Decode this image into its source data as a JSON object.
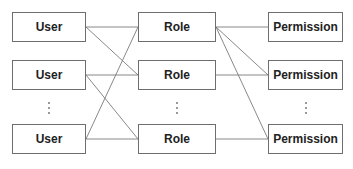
{
  "diagram": {
    "columns": [
      {
        "name": "users",
        "label": "User",
        "x": 12,
        "width": 74,
        "nodes": [
          {
            "id": "u1",
            "label": "User",
            "y": 12
          },
          {
            "id": "u2",
            "label": "User",
            "y": 60
          },
          {
            "id": "u3",
            "label": "User",
            "y": 124
          }
        ]
      },
      {
        "name": "roles",
        "label": "Role",
        "x": 138,
        "width": 78,
        "nodes": [
          {
            "id": "r1",
            "label": "Role",
            "y": 12
          },
          {
            "id": "r2",
            "label": "Role",
            "y": 60
          },
          {
            "id": "r3",
            "label": "Role",
            "y": 124
          }
        ]
      },
      {
        "name": "permissions",
        "label": "Permission",
        "x": 268,
        "width": 75,
        "nodes": [
          {
            "id": "p1",
            "label": "Permission",
            "y": 12
          },
          {
            "id": "p2",
            "label": "Permission",
            "y": 60
          },
          {
            "id": "p3",
            "label": "Permission",
            "y": 124
          }
        ]
      }
    ],
    "node_height": 30,
    "ellipsis": "⋮",
    "edges": [
      [
        "u1",
        "r1"
      ],
      [
        "u1",
        "r2"
      ],
      [
        "u2",
        "r2"
      ],
      [
        "u2",
        "r3"
      ],
      [
        "u3",
        "r1"
      ],
      [
        "u3",
        "r3"
      ],
      [
        "r1",
        "p1"
      ],
      [
        "r1",
        "p2"
      ],
      [
        "r1",
        "p3"
      ],
      [
        "r2",
        "p2"
      ],
      [
        "r3",
        "p3"
      ]
    ],
    "colors": {
      "border": "#6e6e6e",
      "line": "#7a7a7a",
      "text": "#222222"
    }
  }
}
